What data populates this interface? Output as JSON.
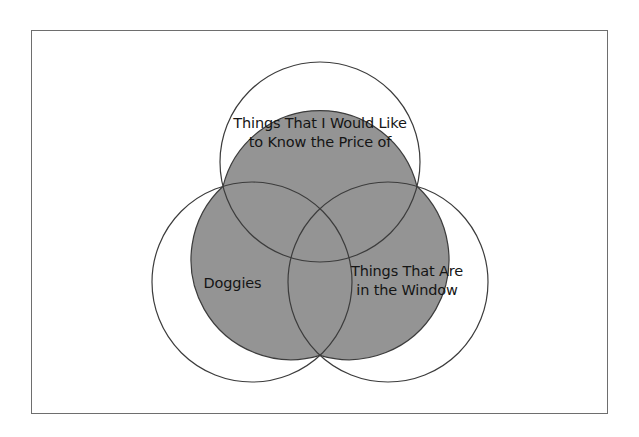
{
  "diagram": {
    "type": "venn-3-circle",
    "title_text": "",
    "background_color": "#ffffff",
    "frame": {
      "border_color": "#6e6e6e",
      "fill_color": "#ffffff"
    },
    "circles": [
      {
        "id": "top",
        "label": "Things That I Would Like\nto Know the Price of",
        "cx": 320,
        "cy": 162,
        "r": 100,
        "stroke_color": "#3c3c3c",
        "fill_color": "none"
      },
      {
        "id": "left",
        "label": "Doggies",
        "cx": 252,
        "cy": 282,
        "r": 100,
        "stroke_color": "#3c3c3c",
        "fill_color": "none"
      },
      {
        "id": "right",
        "label": "Things That Are\nin the Window",
        "cx": 388,
        "cy": 282,
        "r": 100,
        "stroke_color": "#3c3c3c",
        "fill_color": "none"
      }
    ],
    "intersection": {
      "id": "center-all-three",
      "label": "",
      "fill_color": "#949494",
      "stroke_color": "#3c3c3c"
    }
  }
}
